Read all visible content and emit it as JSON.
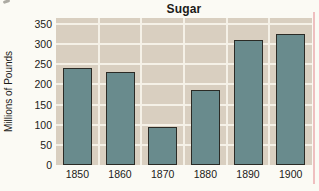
{
  "page": {
    "background": "#fbfaf4",
    "text_color": "#1c1b18"
  },
  "chart_data": {
    "type": "bar",
    "title": "Sugar",
    "xlabel": "",
    "ylabel": "Millions of Pounds",
    "categories": [
      "1850",
      "1860",
      "1870",
      "1880",
      "1890",
      "1900"
    ],
    "values": [
      240,
      230,
      95,
      185,
      310,
      325
    ],
    "ylim": [
      0,
      350
    ],
    "yticks": [
      0,
      50,
      100,
      150,
      200,
      250,
      300,
      350
    ],
    "grid": true,
    "legend": "none",
    "colors": {
      "bar_fill": "#698b8d",
      "bar_border": "#2b2b26",
      "plot_background": "#d9cfc0",
      "gridline": "#f5f1e7"
    }
  }
}
